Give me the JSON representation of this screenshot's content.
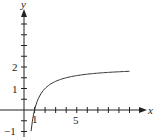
{
  "chart_data": {
    "type": "line",
    "title": "",
    "xlabel": "x",
    "ylabel": "y",
    "x_ticks": [
      1,
      2,
      3,
      4,
      5,
      6,
      7,
      8,
      9,
      10
    ],
    "x_tick_labels": [
      {
        "value": 1,
        "label": "1"
      },
      {
        "value": 5,
        "label": "5"
      }
    ],
    "y_ticks": [
      -1,
      -0.5,
      0.5,
      1,
      1.5,
      2,
      2.5,
      3,
      3.5,
      4
    ],
    "y_tick_labels": [
      {
        "value": -1,
        "label": "-1"
      },
      {
        "value": 1,
        "label": "1"
      },
      {
        "value": 2,
        "label": "2"
      }
    ],
    "xlim": [
      0,
      11
    ],
    "ylim": [
      -1.2,
      4.5
    ],
    "grid": false,
    "legend": null,
    "series": [
      {
        "name": "curve",
        "x": [
          0.67,
          0.8,
          1,
          1.5,
          2,
          3,
          4,
          5,
          6,
          7,
          8,
          9,
          10
        ],
        "y": [
          -1.0,
          -0.5,
          0.0,
          0.67,
          1.0,
          1.33,
          1.5,
          1.6,
          1.67,
          1.71,
          1.75,
          1.78,
          1.8
        ]
      }
    ],
    "colors": {
      "axis": "#222222",
      "curve": "#333333"
    }
  },
  "labels": {
    "x_axis": "x",
    "y_axis": "y",
    "tick_1": "1",
    "tick_5": "5",
    "tick_y1": "1",
    "tick_y2": "2",
    "tick_yneg1": "−1"
  }
}
